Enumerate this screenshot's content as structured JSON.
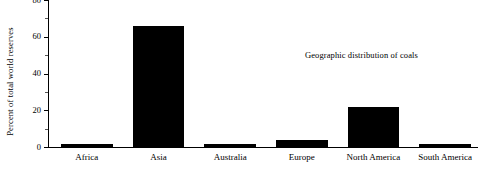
{
  "chart_data": {
    "type": "bar",
    "title": "",
    "subtitle": "",
    "xlabel": "",
    "ylabel": "Percent of total world reserves",
    "categories": [
      "Africa",
      "Asia",
      "Australia",
      "Europe",
      "North America",
      "South America"
    ],
    "values": [
      1.5,
      66,
      1.5,
      3.8,
      22,
      1.5
    ],
    "ylim": [
      0,
      80
    ],
    "yticks": [
      0,
      20,
      40,
      60,
      80
    ],
    "ytick_labels": [
      "0",
      "20",
      "40",
      "60",
      "80"
    ],
    "yminor_ticks": [
      10,
      30,
      50,
      70
    ],
    "grid": false,
    "legend": false,
    "bar_color": "#000000",
    "background_color": "#ffffff",
    "annotations": [
      {
        "text": "Geographic distribution of coals",
        "x": 305,
        "y": 49
      }
    ]
  }
}
